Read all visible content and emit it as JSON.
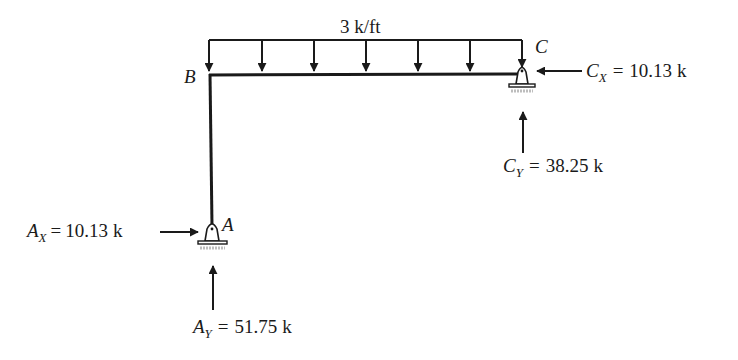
{
  "diagram": {
    "type": "frame-free-body-diagram",
    "distributed_load": {
      "label": "3 k/ft",
      "direction": "downward",
      "arrow_count": 7,
      "span": "B to C"
    },
    "nodes": {
      "A": {
        "label": "A",
        "support": "pin"
      },
      "B": {
        "label": "B",
        "support": "none"
      },
      "C": {
        "label": "C",
        "support": "pin"
      }
    },
    "reactions": [
      {
        "id": "Ax",
        "symbol": "A",
        "subscript": "X",
        "equals": "=",
        "value": "10.13",
        "unit": "k",
        "direction": "right"
      },
      {
        "id": "Ay",
        "symbol": "A",
        "subscript": "Y",
        "equals": "=",
        "value": "51.75",
        "unit": "k",
        "direction": "up"
      },
      {
        "id": "Cx",
        "symbol": "C",
        "subscript": "X",
        "equals": "=",
        "value": "10.13",
        "unit": "k",
        "direction": "left"
      },
      {
        "id": "Cy",
        "symbol": "C",
        "subscript": "Y",
        "equals": "=",
        "value": "38.25",
        "unit": "k",
        "direction": "up"
      }
    ],
    "colors": {
      "ink": "#1a1a1a",
      "background": "#ffffff",
      "hatch": "#bdbdbd"
    }
  }
}
